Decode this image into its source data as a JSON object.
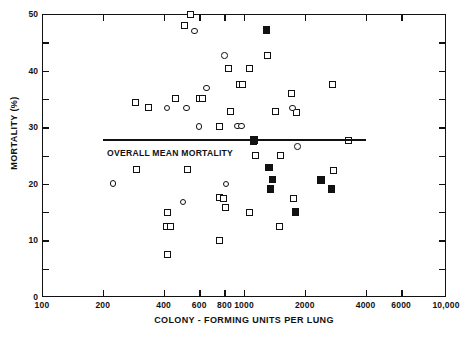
{
  "chart_data": {
    "type": "scatter",
    "title": "",
    "xlabel": "COLONY - FORMING UNITS PER LUNG",
    "ylabel": "MORTALITY (%)",
    "xscale": "log",
    "xlim": [
      100,
      10000
    ],
    "ylim": [
      0,
      50
    ],
    "grid": false,
    "legend": "none",
    "xticks": [
      {
        "value": 100,
        "label": "100"
      },
      {
        "value": 200,
        "label": "200"
      },
      {
        "value": 400,
        "label": "400"
      },
      {
        "value": 600,
        "label": "600"
      },
      {
        "value": 800,
        "label": "800"
      },
      {
        "value": 1000,
        "label": "1000"
      },
      {
        "value": 2000,
        "label": "2000"
      },
      {
        "value": 4000,
        "label": "4000"
      },
      {
        "value": 6000,
        "label": "6000"
      },
      {
        "value": 10000,
        "label": "10,000"
      }
    ],
    "yticks": [
      {
        "value": 0,
        "label": "0",
        "major": true
      },
      {
        "value": 5,
        "label": "",
        "major": false
      },
      {
        "value": 10,
        "label": "10",
        "major": true
      },
      {
        "value": 15,
        "label": "",
        "major": false
      },
      {
        "value": 20,
        "label": "20",
        "major": true
      },
      {
        "value": 25,
        "label": "",
        "major": false
      },
      {
        "value": 30,
        "label": "30",
        "major": true
      },
      {
        "value": 35,
        "label": "",
        "major": false
      },
      {
        "value": 40,
        "label": "40",
        "major": true
      },
      {
        "value": 45,
        "label": "",
        "major": false
      },
      {
        "value": 50,
        "label": "50",
        "major": true
      }
    ],
    "annotations": [
      {
        "name": "overall-mean-mortality",
        "text": "OVERALL MEAN MORTALITY",
        "type": "horizontal-line-with-label",
        "y": 27.7,
        "x_start": 200,
        "x_end": 4000,
        "label_x": 210,
        "label_y": 25.5
      }
    ],
    "series": [
      {
        "name": "open-square",
        "marker": "square-open",
        "color": "#111111",
        "points": [
          [
            545,
            50.0
          ],
          [
            505,
            48.0
          ],
          [
            1300,
            42.7
          ],
          [
            840,
            40.3
          ],
          [
            1060,
            40.3
          ],
          [
            955,
            37.6
          ],
          [
            985,
            37.6
          ],
          [
            2750,
            37.5
          ],
          [
            1720,
            36.0
          ],
          [
            290,
            34.3
          ],
          [
            460,
            35.0
          ],
          [
            600,
            35.1
          ],
          [
            620,
            35.1
          ],
          [
            335,
            33.4
          ],
          [
            860,
            32.7
          ],
          [
            1440,
            32.8
          ],
          [
            1810,
            32.6
          ],
          [
            760,
            30.1
          ],
          [
            1120,
            27.5
          ],
          [
            3280,
            27.6
          ],
          [
            1140,
            25.0
          ],
          [
            1510,
            25.0
          ],
          [
            295,
            22.6
          ],
          [
            525,
            22.6
          ],
          [
            2770,
            22.4
          ],
          [
            755,
            17.5
          ],
          [
            790,
            17.4
          ],
          [
            1760,
            17.4
          ],
          [
            810,
            15.9
          ],
          [
            420,
            15.0
          ],
          [
            1060,
            15.0
          ],
          [
            415,
            12.5
          ],
          [
            435,
            12.5
          ],
          [
            1500,
            12.5
          ],
          [
            760,
            10.0
          ],
          [
            420,
            7.5
          ]
        ]
      },
      {
        "name": "open-circle",
        "marker": "circle-open",
        "color": "#111111",
        "points": [
          [
            570,
            47.0
          ],
          [
            800,
            42.7
          ],
          [
            650,
            36.9
          ],
          [
            415,
            33.4
          ],
          [
            520,
            33.4
          ],
          [
            1740,
            33.4
          ],
          [
            600,
            30.1
          ],
          [
            930,
            30.2
          ],
          [
            975,
            30.2
          ],
          [
            1840,
            26.6
          ],
          [
            225,
            20.1
          ],
          [
            815,
            20.0
          ],
          [
            500,
            16.8
          ]
        ]
      },
      {
        "name": "filled-square",
        "marker": "square-filled",
        "color": "#111111",
        "points": [
          [
            1290,
            47.2
          ],
          [
            1120,
            27.7
          ],
          [
            1330,
            22.9
          ],
          [
            1380,
            20.8
          ],
          [
            2400,
            20.7
          ],
          [
            1350,
            19.1
          ],
          [
            2710,
            19.1
          ],
          [
            1800,
            15.0
          ]
        ]
      }
    ]
  }
}
